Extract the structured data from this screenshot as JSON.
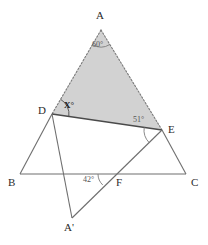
{
  "figure": {
    "background_color": "#ffffff",
    "shaded_fill": "#d2d2d2",
    "stroke_color": "#6b6b6b",
    "solid_stroke_color": "#5a5a5a",
    "label_color": "#2b2b2b",
    "angle_label_color": "#555555"
  },
  "vertices": {
    "A": {
      "label": "A",
      "x": 101,
      "y": 30,
      "label_x": 96,
      "label_y": 10
    },
    "B": {
      "label": "B",
      "x": 20,
      "y": 174,
      "label_x": 8,
      "label_y": 177
    },
    "C": {
      "label": "C",
      "x": 186,
      "y": 174,
      "label_x": 191,
      "label_y": 177
    },
    "D": {
      "label": "D",
      "x": 52,
      "y": 114,
      "label_x": 38,
      "label_y": 105
    },
    "E": {
      "label": "E",
      "x": 162,
      "y": 130,
      "label_x": 168,
      "label_y": 124
    },
    "F": {
      "label": "F",
      "x": 113,
      "y": 174,
      "label_x": 116,
      "label_y": 177
    },
    "Aprime": {
      "label": "A'",
      "x": 72,
      "y": 218,
      "label_x": 64,
      "label_y": 222
    }
  },
  "angles": [
    {
      "name": "angle-at-A",
      "value": "60°",
      "at": "A",
      "x": 92,
      "y": 41,
      "style": "light"
    },
    {
      "name": "angle-at-D",
      "value": "X°",
      "at": "D",
      "x": 64,
      "y": 101,
      "style": "dark"
    },
    {
      "name": "angle-at-E",
      "value": "51°",
      "at": "E",
      "x": 133,
      "y": 116,
      "style": "light"
    },
    {
      "name": "angle-at-F",
      "value": "42°",
      "at": "F",
      "x": 83,
      "y": 176,
      "style": "light"
    }
  ],
  "segments": [
    {
      "name": "segment-A-D",
      "from": "A",
      "to": "D",
      "style": "dotted"
    },
    {
      "name": "segment-A-E",
      "from": "A",
      "to": "E",
      "style": "dotted"
    },
    {
      "name": "segment-D-E",
      "from": "D",
      "to": "E",
      "style": "solid-bold"
    },
    {
      "name": "segment-B-C",
      "from": "B",
      "to": "C",
      "style": "solid"
    },
    {
      "name": "segment-B-D",
      "from": "B",
      "to": "D",
      "style": "solid"
    },
    {
      "name": "segment-C-E",
      "from": "C",
      "to": "E",
      "style": "solid"
    },
    {
      "name": "segment-D-Aprime",
      "from": "D",
      "to": "Aprime",
      "style": "solid"
    },
    {
      "name": "segment-E-Aprime",
      "from": "E",
      "to": "Aprime",
      "style": "solid"
    }
  ],
  "shaded_region": {
    "name": "shaded-triangle-ADE",
    "points": "A, D, E",
    "fill": "#d2d2d2"
  }
}
